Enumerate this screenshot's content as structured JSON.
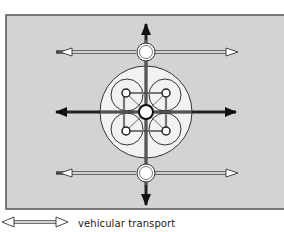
{
  "diagram": {
    "type": "urban-transport-network",
    "colors": {
      "background": "#d3d3d3",
      "frame": "#555555",
      "node_fill": "#ffffff",
      "line": "#222222",
      "primary_arrow": "#111111"
    },
    "nodes": [
      {
        "id": "top-node",
        "role": "transit-station"
      },
      {
        "id": "bottom-node",
        "role": "transit-station"
      },
      {
        "id": "central-hub",
        "role": "main-hub"
      },
      {
        "id": "district-nw",
        "role": "sub-district"
      },
      {
        "id": "district-ne",
        "role": "sub-district"
      },
      {
        "id": "district-sw",
        "role": "sub-district"
      },
      {
        "id": "district-se",
        "role": "sub-district"
      }
    ],
    "arrows": {
      "vehicular": [
        "top-left",
        "top-right",
        "bottom-left",
        "bottom-right"
      ],
      "primary": [
        "north",
        "south",
        "east",
        "west"
      ]
    }
  },
  "legend": {
    "items": [
      {
        "symbol": "double-headed-hollow-arrow",
        "label": "vehicular transport"
      }
    ]
  }
}
